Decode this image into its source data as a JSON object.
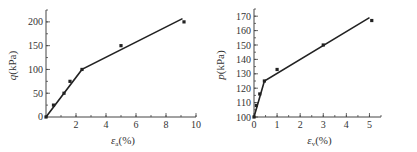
{
  "chart_data": [
    {
      "type": "scatter",
      "title": "",
      "xlabel": "ε_a(%)",
      "ylabel": "q(kPa)",
      "xlim": [
        0,
        10
      ],
      "ylim": [
        0,
        225
      ],
      "x_ticks": [
        2,
        4,
        6,
        8,
        10
      ],
      "x_minor_step": 1,
      "y_ticks": [
        0,
        50,
        100,
        150,
        200
      ],
      "y_minor_step": 25,
      "grid": false,
      "points": [
        [
          0,
          0
        ],
        [
          0.5,
          25
        ],
        [
          1.2,
          50
        ],
        [
          1.6,
          75
        ],
        [
          2.4,
          100
        ],
        [
          5.0,
          150
        ],
        [
          9.2,
          200
        ]
      ],
      "fit_line": [
        [
          0,
          0
        ],
        [
          2.4,
          100
        ],
        [
          9.1,
          207
        ]
      ]
    },
    {
      "type": "scatter",
      "title": "",
      "xlabel": "ε_v(%)",
      "ylabel": "p(kPa)",
      "xlim": [
        0,
        5.5
      ],
      "ylim": [
        100,
        175
      ],
      "x_ticks": [
        0,
        1,
        2,
        3,
        4,
        5
      ],
      "x_minor_step": 0.5,
      "y_ticks": [
        100,
        110,
        120,
        130,
        140,
        150,
        160,
        170
      ],
      "y_minor_step": 5,
      "grid": false,
      "points": [
        [
          0,
          100
        ],
        [
          0.1,
          108
        ],
        [
          0.25,
          116
        ],
        [
          0.45,
          125
        ],
        [
          1.0,
          133
        ],
        [
          3.0,
          150
        ],
        [
          5.1,
          167
        ]
      ],
      "fit_line": [
        [
          0,
          100
        ],
        [
          0.45,
          125
        ],
        [
          5.0,
          169
        ]
      ]
    }
  ],
  "charts": [
    {
      "xlabel_main": "ε",
      "xlabel_sub": "a",
      "xlabel_suffix": "(%)",
      "ylabel_main": "q",
      "ylabel_suffix": "(kPa)"
    },
    {
      "xlabel_main": "ε",
      "xlabel_sub": "v",
      "xlabel_suffix": "(%)",
      "ylabel_main": "p",
      "ylabel_suffix": "(kPa)"
    }
  ]
}
